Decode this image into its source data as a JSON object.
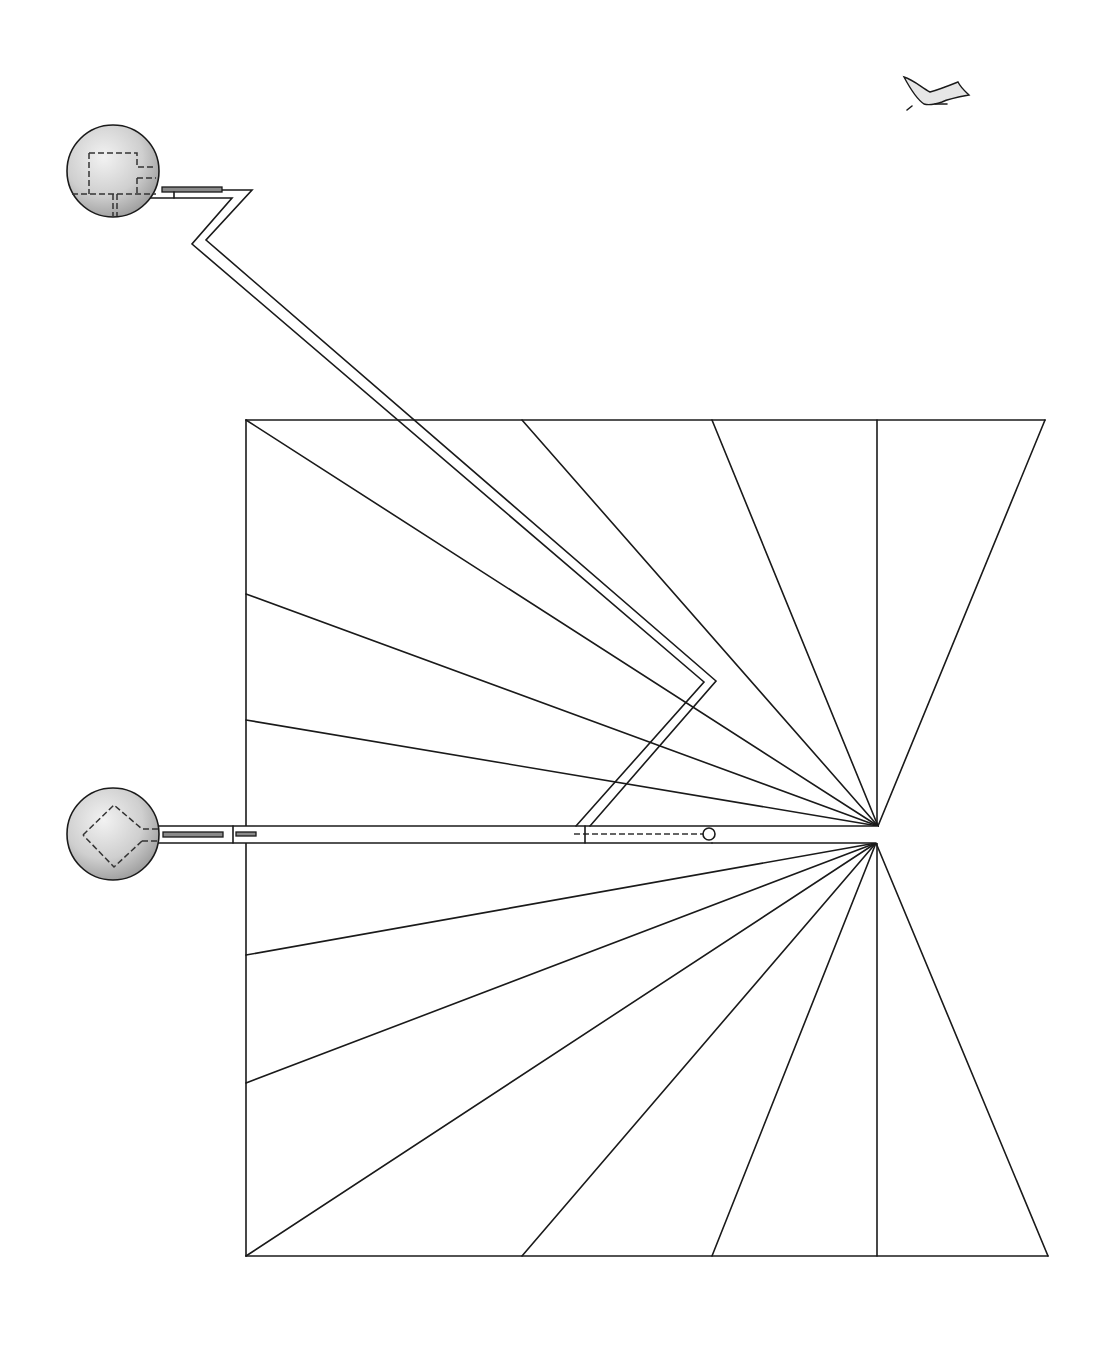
{
  "drawing": {
    "type": "architectural-plan",
    "description": "Line drawing: fan of rays inside a rectangular/trapezoidal frame, zig-zag corridor connecting two spherical pods",
    "colors": {
      "line": "#1a1a1a",
      "sphere_fill_light": "#e8e8e8",
      "sphere_fill_dark": "#a8a8a8",
      "bar_fill": "#8a8a8a",
      "background": "#ffffff"
    }
  },
  "frame": {
    "top_y": 420,
    "bottom_y": 1256,
    "left_x": 246,
    "top_right_x": 1045,
    "bottom_right_x": 1048,
    "vertical_divider_x": 877
  },
  "apex": {
    "upper": [
      878,
      826
    ],
    "lower": [
      876,
      843
    ]
  },
  "rays_upper": [
    [
      246,
      420
    ],
    [
      522,
      420
    ],
    [
      712,
      420
    ],
    [
      246,
      594
    ],
    [
      246,
      720
    ],
    [
      1045,
      420
    ]
  ],
  "rays_lower": [
    [
      246,
      955
    ],
    [
      246,
      1083
    ],
    [
      246,
      1256
    ],
    [
      522,
      1256
    ],
    [
      712,
      1256
    ],
    [
      1048,
      1256
    ]
  ],
  "spheres": [
    {
      "id": "upper-pod",
      "cx": 113,
      "cy": 171,
      "r": 46,
      "plan": "rectangular-room"
    },
    {
      "id": "lower-pod",
      "cx": 113,
      "cy": 834,
      "r": 46,
      "plan": "diamond-room"
    }
  ],
  "bird": {
    "x": 900,
    "y": 75,
    "label": "bird-sketch"
  }
}
